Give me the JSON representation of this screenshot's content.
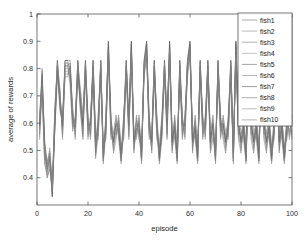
{
  "chart_data": {
    "type": "line",
    "title": "",
    "xlabel": "episode",
    "ylabel": "average of rewards",
    "xlim": [
      0,
      100
    ],
    "ylim": [
      0.3,
      1.0
    ],
    "xticks": [
      0,
      20,
      40,
      60,
      80,
      100
    ],
    "xtick_labels": [
      "0",
      "20",
      "40",
      "60",
      "80",
      "100"
    ],
    "yticks": [
      0.4,
      0.5,
      0.6,
      0.7,
      0.8,
      0.9,
      1
    ],
    "ytick_labels": [
      "0.4",
      "0.5",
      "0.6",
      "0.7",
      "0.8",
      "0.9",
      "1"
    ],
    "grid": false,
    "legend_position": "upper right",
    "legend_entries": [
      "fish1",
      "fish2",
      "fish3",
      "fish4",
      "fish5",
      "fish6",
      "fish7",
      "fish8",
      "fish9",
      "fish10"
    ],
    "series_colors": [
      "#6f6f6f",
      "#8a8a8a",
      "#7b7b7b",
      "#9a9a9a",
      "#666666",
      "#858585",
      "#5a5a5a",
      "#747474",
      "#8f8f8f",
      "#7f7f7f"
    ],
    "x": [
      1,
      2,
      3,
      4,
      5,
      6,
      7,
      8,
      9,
      10,
      11,
      12,
      13,
      14,
      15,
      16,
      17,
      18,
      19,
      20,
      21,
      22,
      23,
      24,
      25,
      26,
      27,
      28,
      29,
      30,
      31,
      32,
      33,
      34,
      35,
      36,
      37,
      38,
      39,
      40,
      41,
      42,
      43,
      44,
      45,
      46,
      47,
      48,
      49,
      50,
      51,
      52,
      53,
      54,
      55,
      56,
      57,
      58,
      59,
      60,
      61,
      62,
      63,
      64,
      65,
      66,
      67,
      68,
      69,
      70,
      71,
      72,
      73,
      74,
      75,
      76,
      77,
      78,
      79,
      80,
      81,
      82,
      83,
      84,
      85,
      86,
      87,
      88,
      89,
      90,
      91,
      92,
      93,
      94,
      95,
      96,
      97,
      98,
      99,
      100
    ],
    "series": [
      {
        "name": "fish1",
        "values": [
          0.6,
          0.8,
          0.5,
          0.43,
          0.47,
          0.33,
          0.6,
          0.83,
          0.7,
          0.57,
          0.83,
          0.83,
          0.83,
          0.63,
          0.57,
          0.83,
          0.7,
          0.6,
          0.83,
          0.57,
          0.6,
          0.83,
          0.5,
          0.57,
          0.83,
          0.46,
          0.6,
          0.9,
          0.57,
          0.53,
          0.6,
          0.57,
          0.46,
          0.6,
          0.83,
          0.57,
          0.9,
          0.53,
          0.57,
          0.6,
          0.46,
          0.83,
          0.9,
          0.57,
          0.53,
          0.83,
          0.6,
          0.46,
          0.57,
          0.83,
          0.6,
          0.9,
          0.53,
          0.57,
          0.46,
          0.83,
          0.6,
          0.57,
          0.83,
          0.9,
          0.53,
          0.57,
          0.46,
          0.83,
          0.6,
          0.57,
          0.83,
          0.53,
          0.6,
          0.46,
          0.83,
          0.57,
          0.6,
          0.53,
          0.57,
          0.83,
          0.46,
          0.9,
          0.6,
          0.53,
          0.57,
          0.46,
          0.83,
          0.6,
          0.53,
          0.57,
          0.46,
          0.83,
          0.6,
          0.53,
          0.57,
          0.46,
          0.6,
          0.83,
          0.53,
          0.57,
          0.46,
          0.6,
          0.57,
          0.6
        ]
      },
      {
        "name": "fish2",
        "values": [
          0.57,
          0.74,
          0.46,
          0.4,
          0.44,
          0.36,
          0.63,
          0.8,
          0.66,
          0.6,
          0.8,
          0.8,
          0.78,
          0.6,
          0.6,
          0.8,
          0.66,
          0.57,
          0.8,
          0.6,
          0.57,
          0.8,
          0.53,
          0.6,
          0.8,
          0.5,
          0.57,
          0.85,
          0.6,
          0.5,
          0.57,
          0.6,
          0.5,
          0.57,
          0.8,
          0.6,
          0.85,
          0.5,
          0.6,
          0.57,
          0.5,
          0.8,
          0.85,
          0.6,
          0.5,
          0.8,
          0.57,
          0.5,
          0.6,
          0.8,
          0.57,
          0.85,
          0.5,
          0.6,
          0.5,
          0.8,
          0.57,
          0.6,
          0.8,
          0.85,
          0.5,
          0.6,
          0.5,
          0.8,
          0.57,
          0.6,
          0.8,
          0.5,
          0.57,
          0.5,
          0.8,
          0.6,
          0.57,
          0.5,
          0.6,
          0.8,
          0.5,
          0.85,
          0.57,
          0.5,
          0.6,
          0.5,
          0.8,
          0.57,
          0.5,
          0.6,
          0.5,
          0.8,
          0.57,
          0.5,
          0.6,
          0.5,
          0.57,
          0.8,
          0.5,
          0.6,
          0.5,
          0.57,
          0.6,
          0.57
        ]
      },
      {
        "name": "fish3",
        "values": [
          0.63,
          0.77,
          0.53,
          0.46,
          0.5,
          0.38,
          0.57,
          0.78,
          0.72,
          0.55,
          0.78,
          0.78,
          0.8,
          0.66,
          0.55,
          0.78,
          0.72,
          0.63,
          0.78,
          0.55,
          0.63,
          0.78,
          0.48,
          0.55,
          0.78,
          0.48,
          0.63,
          0.87,
          0.55,
          0.55,
          0.63,
          0.55,
          0.48,
          0.63,
          0.78,
          0.55,
          0.87,
          0.55,
          0.55,
          0.63,
          0.48,
          0.78,
          0.87,
          0.55,
          0.55,
          0.78,
          0.63,
          0.48,
          0.55,
          0.78,
          0.63,
          0.87,
          0.55,
          0.55,
          0.48,
          0.78,
          0.63,
          0.55,
          0.78,
          0.87,
          0.55,
          0.55,
          0.48,
          0.78,
          0.63,
          0.55,
          0.78,
          0.55,
          0.63,
          0.48,
          0.78,
          0.55,
          0.63,
          0.55,
          0.55,
          0.78,
          0.48,
          0.87,
          0.63,
          0.55,
          0.55,
          0.48,
          0.78,
          0.63,
          0.55,
          0.55,
          0.48,
          0.78,
          0.63,
          0.55,
          0.55,
          0.48,
          0.63,
          0.78,
          0.55,
          0.55,
          0.48,
          0.63,
          0.55,
          0.63
        ]
      },
      {
        "name": "fish4",
        "values": [
          0.55,
          0.7,
          0.48,
          0.42,
          0.46,
          0.35,
          0.62,
          0.82,
          0.64,
          0.62,
          0.82,
          0.82,
          0.75,
          0.58,
          0.62,
          0.82,
          0.64,
          0.55,
          0.82,
          0.62,
          0.55,
          0.82,
          0.55,
          0.62,
          0.82,
          0.47,
          0.55,
          0.88,
          0.62,
          0.52,
          0.55,
          0.62,
          0.47,
          0.55,
          0.82,
          0.62,
          0.88,
          0.52,
          0.62,
          0.55,
          0.47,
          0.82,
          0.88,
          0.62,
          0.52,
          0.82,
          0.55,
          0.47,
          0.62,
          0.82,
          0.55,
          0.88,
          0.52,
          0.62,
          0.47,
          0.82,
          0.55,
          0.62,
          0.82,
          0.88,
          0.52,
          0.62,
          0.47,
          0.82,
          0.55,
          0.62,
          0.82,
          0.52,
          0.55,
          0.47,
          0.82,
          0.62,
          0.55,
          0.52,
          0.62,
          0.82,
          0.47,
          0.88,
          0.55,
          0.52,
          0.62,
          0.47,
          0.82,
          0.55,
          0.52,
          0.62,
          0.47,
          0.82,
          0.55,
          0.52,
          0.62,
          0.47,
          0.55,
          0.82,
          0.52,
          0.62,
          0.47,
          0.55,
          0.62,
          0.55
        ]
      },
      {
        "name": "fish5",
        "values": [
          0.58,
          0.76,
          0.52,
          0.45,
          0.49,
          0.34,
          0.59,
          0.81,
          0.68,
          0.58,
          0.81,
          0.81,
          0.82,
          0.62,
          0.58,
          0.81,
          0.68,
          0.59,
          0.81,
          0.58,
          0.59,
          0.81,
          0.51,
          0.58,
          0.81,
          0.46,
          0.59,
          0.89,
          0.58,
          0.54,
          0.59,
          0.58,
          0.46,
          0.59,
          0.81,
          0.58,
          0.89,
          0.54,
          0.58,
          0.59,
          0.46,
          0.81,
          0.89,
          0.58,
          0.54,
          0.81,
          0.59,
          0.46,
          0.58,
          0.81,
          0.59,
          0.89,
          0.54,
          0.58,
          0.46,
          0.81,
          0.59,
          0.58,
          0.81,
          0.89,
          0.54,
          0.58,
          0.46,
          0.81,
          0.59,
          0.58,
          0.81,
          0.54,
          0.59,
          0.46,
          0.81,
          0.58,
          0.59,
          0.54,
          0.58,
          0.81,
          0.46,
          0.89,
          0.59,
          0.54,
          0.58,
          0.46,
          0.81,
          0.59,
          0.54,
          0.58,
          0.46,
          0.81,
          0.59,
          0.54,
          0.58,
          0.46,
          0.59,
          0.81,
          0.54,
          0.58,
          0.46,
          0.59,
          0.58,
          0.59
        ]
      },
      {
        "name": "fish6",
        "values": [
          0.61,
          0.72,
          0.45,
          0.41,
          0.45,
          0.37,
          0.64,
          0.79,
          0.71,
          0.56,
          0.79,
          0.79,
          0.77,
          0.64,
          0.56,
          0.79,
          0.71,
          0.61,
          0.79,
          0.56,
          0.61,
          0.79,
          0.52,
          0.56,
          0.79,
          0.49,
          0.61,
          0.86,
          0.56,
          0.51,
          0.61,
          0.56,
          0.49,
          0.61,
          0.79,
          0.56,
          0.86,
          0.51,
          0.56,
          0.61,
          0.49,
          0.79,
          0.86,
          0.56,
          0.51,
          0.79,
          0.61,
          0.49,
          0.56,
          0.79,
          0.61,
          0.86,
          0.51,
          0.56,
          0.49,
          0.79,
          0.61,
          0.56,
          0.79,
          0.86,
          0.51,
          0.56,
          0.49,
          0.79,
          0.61,
          0.56,
          0.79,
          0.51,
          0.61,
          0.49,
          0.79,
          0.56,
          0.61,
          0.51,
          0.56,
          0.79,
          0.49,
          0.86,
          0.61,
          0.51,
          0.56,
          0.49,
          0.79,
          0.61,
          0.51,
          0.56,
          0.49,
          0.79,
          0.61,
          0.51,
          0.56,
          0.49,
          0.61,
          0.79,
          0.51,
          0.56,
          0.49,
          0.61,
          0.56,
          0.61
        ]
      },
      {
        "name": "fish7",
        "values": [
          0.59,
          0.78,
          0.49,
          0.44,
          0.48,
          0.33,
          0.61,
          0.83,
          0.67,
          0.59,
          0.83,
          0.83,
          0.79,
          0.59,
          0.59,
          0.83,
          0.67,
          0.6,
          0.83,
          0.59,
          0.6,
          0.83,
          0.54,
          0.59,
          0.83,
          0.47,
          0.6,
          0.9,
          0.59,
          0.53,
          0.6,
          0.59,
          0.47,
          0.6,
          0.83,
          0.59,
          0.9,
          0.53,
          0.59,
          0.6,
          0.47,
          0.83,
          0.9,
          0.59,
          0.53,
          0.83,
          0.6,
          0.47,
          0.59,
          0.83,
          0.6,
          0.9,
          0.53,
          0.59,
          0.47,
          0.83,
          0.6,
          0.59,
          0.83,
          0.9,
          0.53,
          0.59,
          0.47,
          0.83,
          0.6,
          0.59,
          0.83,
          0.53,
          0.6,
          0.47,
          0.83,
          0.59,
          0.6,
          0.53,
          0.59,
          0.83,
          0.47,
          0.9,
          0.6,
          0.53,
          0.59,
          0.47,
          0.83,
          0.6,
          0.53,
          0.59,
          0.47,
          0.83,
          0.6,
          0.53,
          0.59,
          0.47,
          0.6,
          0.83,
          0.53,
          0.59,
          0.47,
          0.6,
          0.59,
          0.6
        ]
      },
      {
        "name": "fish8",
        "values": [
          0.56,
          0.75,
          0.51,
          0.43,
          0.47,
          0.39,
          0.58,
          0.77,
          0.69,
          0.61,
          0.77,
          0.77,
          0.81,
          0.61,
          0.61,
          0.77,
          0.69,
          0.56,
          0.77,
          0.61,
          0.56,
          0.77,
          0.49,
          0.61,
          0.77,
          0.51,
          0.56,
          0.84,
          0.61,
          0.56,
          0.56,
          0.61,
          0.51,
          0.56,
          0.77,
          0.61,
          0.84,
          0.56,
          0.61,
          0.56,
          0.51,
          0.77,
          0.84,
          0.61,
          0.56,
          0.77,
          0.56,
          0.51,
          0.61,
          0.77,
          0.56,
          0.84,
          0.56,
          0.61,
          0.51,
          0.77,
          0.56,
          0.61,
          0.77,
          0.84,
          0.56,
          0.61,
          0.51,
          0.77,
          0.56,
          0.61,
          0.77,
          0.56,
          0.56,
          0.51,
          0.77,
          0.61,
          0.56,
          0.56,
          0.61,
          0.77,
          0.51,
          0.84,
          0.56,
          0.56,
          0.61,
          0.51,
          0.77,
          0.56,
          0.56,
          0.61,
          0.51,
          0.77,
          0.56,
          0.56,
          0.61,
          0.51,
          0.56,
          0.77,
          0.56,
          0.61,
          0.51,
          0.56,
          0.61,
          0.56
        ]
      },
      {
        "name": "fish9",
        "values": [
          0.62,
          0.73,
          0.47,
          0.42,
          0.51,
          0.36,
          0.65,
          0.82,
          0.73,
          0.54,
          0.82,
          0.82,
          0.76,
          0.65,
          0.54,
          0.82,
          0.73,
          0.62,
          0.82,
          0.54,
          0.62,
          0.82,
          0.56,
          0.54,
          0.82,
          0.45,
          0.62,
          0.85,
          0.54,
          0.57,
          0.62,
          0.54,
          0.45,
          0.62,
          0.82,
          0.54,
          0.85,
          0.57,
          0.54,
          0.62,
          0.45,
          0.82,
          0.85,
          0.54,
          0.57,
          0.82,
          0.62,
          0.45,
          0.54,
          0.82,
          0.62,
          0.85,
          0.57,
          0.54,
          0.45,
          0.82,
          0.62,
          0.54,
          0.82,
          0.85,
          0.57,
          0.54,
          0.45,
          0.82,
          0.62,
          0.54,
          0.82,
          0.57,
          0.62,
          0.45,
          0.82,
          0.54,
          0.62,
          0.57,
          0.54,
          0.82,
          0.45,
          0.85,
          0.62,
          0.57,
          0.54,
          0.45,
          0.82,
          0.62,
          0.57,
          0.54,
          0.45,
          0.82,
          0.62,
          0.57,
          0.54,
          0.45,
          0.62,
          0.82,
          0.57,
          0.54,
          0.45,
          0.62,
          0.54,
          0.62
        ]
      },
      {
        "name": "fish10",
        "values": [
          0.54,
          0.79,
          0.54,
          0.4,
          0.43,
          0.35,
          0.66,
          0.81,
          0.65,
          0.63,
          0.81,
          0.81,
          0.74,
          0.57,
          0.63,
          0.81,
          0.65,
          0.54,
          0.81,
          0.63,
          0.54,
          0.81,
          0.47,
          0.63,
          0.81,
          0.52,
          0.54,
          0.87,
          0.63,
          0.49,
          0.54,
          0.63,
          0.52,
          0.54,
          0.81,
          0.63,
          0.87,
          0.49,
          0.63,
          0.54,
          0.52,
          0.81,
          0.87,
          0.63,
          0.49,
          0.81,
          0.54,
          0.52,
          0.63,
          0.81,
          0.54,
          0.87,
          0.49,
          0.63,
          0.52,
          0.81,
          0.54,
          0.63,
          0.81,
          0.87,
          0.49,
          0.63,
          0.52,
          0.81,
          0.54,
          0.63,
          0.81,
          0.49,
          0.54,
          0.52,
          0.81,
          0.63,
          0.54,
          0.49,
          0.63,
          0.81,
          0.52,
          0.87,
          0.54,
          0.49,
          0.63,
          0.52,
          0.81,
          0.54,
          0.49,
          0.63,
          0.52,
          0.81,
          0.54,
          0.49,
          0.63,
          0.52,
          0.54,
          0.81,
          0.49,
          0.63,
          0.52,
          0.54,
          0.63,
          0.54
        ]
      }
    ]
  }
}
